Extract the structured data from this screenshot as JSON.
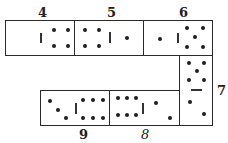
{
  "figure": {
    "labels": {
      "d4": "4",
      "d5": "5",
      "d6": "6",
      "d7": "7",
      "d8": "8",
      "d9": "9"
    },
    "dominoes": [
      {
        "id": "4",
        "orientation": "horizontal",
        "left_pips": 0,
        "right_pips": 4
      },
      {
        "id": "5",
        "orientation": "horizontal",
        "left_pips": 4,
        "right_pips": 1
      },
      {
        "id": "6",
        "orientation": "horizontal",
        "left_pips": 1,
        "right_pips": 5
      },
      {
        "id": "7",
        "orientation": "vertical",
        "top_pips": 5,
        "bottom_pips": 2
      },
      {
        "id": "8",
        "orientation": "horizontal",
        "left_pips": 6,
        "right_pips": 2
      },
      {
        "id": "9",
        "orientation": "horizontal",
        "left_pips": 3,
        "right_pips": 6
      }
    ],
    "colors": {
      "ink": "#1e1e1e",
      "background": "#ffffff"
    }
  }
}
